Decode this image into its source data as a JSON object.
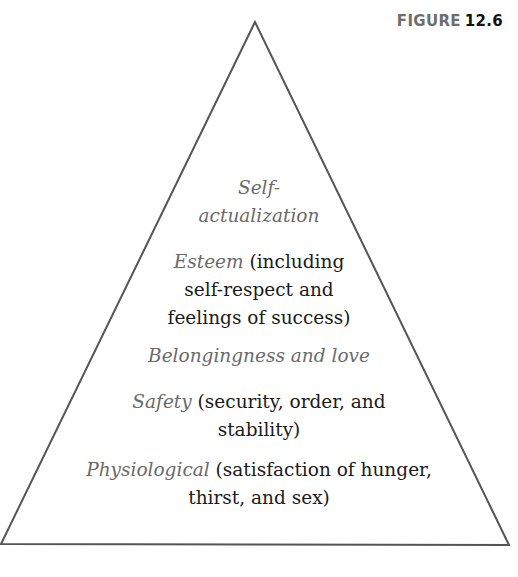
{
  "figure": {
    "label_word": "FIGURE",
    "label_number": "12.6"
  },
  "pyramid": {
    "shape": "triangle",
    "apex": [
      255,
      22
    ],
    "base_left": [
      1,
      544
    ],
    "base_right": [
      509,
      545
    ],
    "stroke_color": "#555555",
    "term_color": "#6a6a6a",
    "detail_color": "#1a1a1a",
    "levels": [
      {
        "id": "self-actualization",
        "lines": [
          {
            "term": "Self-",
            "detail": ""
          },
          {
            "term": "actualization",
            "detail": ""
          }
        ]
      },
      {
        "id": "esteem",
        "lines": [
          {
            "term": "Esteem",
            "detail": " (including"
          },
          {
            "term": "",
            "detail": "self-respect and"
          },
          {
            "term": "",
            "detail": "feelings of success)"
          }
        ]
      },
      {
        "id": "belongingness",
        "lines": [
          {
            "term": "Belongingness and love",
            "detail": ""
          }
        ]
      },
      {
        "id": "safety",
        "lines": [
          {
            "term": "Safety",
            "detail": " (security, order, and"
          },
          {
            "term": "",
            "detail": "stability)"
          }
        ]
      },
      {
        "id": "physiological",
        "lines": [
          {
            "term": "Physiological",
            "detail": " (satisfaction of hunger,"
          },
          {
            "term": "",
            "detail": "thirst, and sex)"
          }
        ]
      }
    ]
  }
}
